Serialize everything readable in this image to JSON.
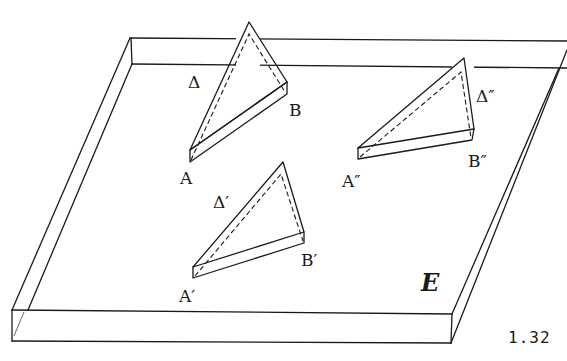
{
  "figure": {
    "number": "1.32",
    "plane_label": "E",
    "triangles": [
      {
        "name": "Δ",
        "vertex_a": "A",
        "vertex_b": "B"
      },
      {
        "name": "Δ′",
        "vertex_a": "A′",
        "vertex_b": "B′"
      },
      {
        "name": "Δ″",
        "vertex_a": "A″",
        "vertex_b": "B″"
      }
    ]
  }
}
